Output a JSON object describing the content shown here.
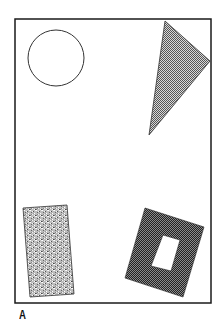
{
  "figure": {
    "label": "A",
    "frame": {
      "x": 15,
      "y": 19,
      "width": 196,
      "height": 284,
      "stroke": "#1a1a1a"
    },
    "shapes": [
      {
        "type": "circle",
        "cx": 56,
        "cy": 58,
        "r": 28,
        "fill": "none",
        "stroke": "#333333"
      },
      {
        "type": "triangle",
        "points": "165,21 210,61 149,135",
        "fill": "checkered-light",
        "stroke": "#333333"
      },
      {
        "type": "rectangle",
        "points": "23,208 67,205 74,294 30,297",
        "fill": "speckled-gray",
        "stroke": "#333333"
      },
      {
        "type": "square-frame",
        "outer": "145,208 204,227 183,297 125,278",
        "inner": "163,235 180,240 171,271 151,266",
        "fill": "checkered-dark",
        "stroke": "#222222"
      }
    ]
  }
}
